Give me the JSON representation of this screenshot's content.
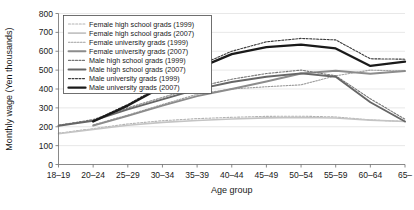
{
  "chart_data": {
    "type": "line",
    "title": "",
    "xlabel": "Age group",
    "ylabel": "Monthly wage (Yen thousands)",
    "categories": [
      "18–19",
      "20–24",
      "25–29",
      "30–34",
      "35–39",
      "40–44",
      "45–49",
      "50–54",
      "55–59",
      "60–64",
      "65–"
    ],
    "ylim": [
      0,
      800
    ],
    "yticks": [
      0,
      100,
      200,
      300,
      400,
      500,
      600,
      700,
      800
    ],
    "ytick_labels": [
      "0",
      "100",
      "200",
      "300",
      "400",
      "500",
      "600",
      "700",
      "800"
    ],
    "grid": true,
    "legend_position": "top-left",
    "series": [
      {
        "name": "Female high school grads (1999)",
        "color": "#b3b3b3",
        "width": 1.1,
        "dash": "2,1.6",
        "values": [
          166,
          190,
          215,
          232,
          243,
          250,
          255,
          256,
          252,
          236,
          228
        ]
      },
      {
        "name": "Female high school grads (2007)",
        "color": "#c4c4c4",
        "width": 1.6,
        "dash": "none",
        "values": [
          163,
          186,
          208,
          223,
          233,
          241,
          247,
          249,
          246,
          235,
          228
        ]
      },
      {
        "name": "Female university grads (1999)",
        "color": "#9e9e9e",
        "width": 1.1,
        "dash": "1.6,1.4",
        "values": [
          null,
          210,
          262,
          318,
          372,
          400,
          412,
          422,
          470,
          500,
          495
        ]
      },
      {
        "name": "Female university grads (2007)",
        "color": "#8c8c8c",
        "width": 1.9,
        "dash": "none",
        "values": [
          null,
          206,
          258,
          312,
          362,
          400,
          440,
          482,
          497,
          481,
          495
        ]
      },
      {
        "name": "Male high school grads (1999)",
        "color": "#777777",
        "width": 1.1,
        "dash": "2,1.5",
        "values": [
          208,
          238,
          300,
          355,
          410,
          452,
          482,
          500,
          470,
          348,
          240
        ]
      },
      {
        "name": "Male high school grads (2007)",
        "color": "#666666",
        "width": 1.9,
        "dash": "none",
        "values": [
          205,
          232,
          292,
          345,
          398,
          437,
          465,
          483,
          465,
          330,
          228
        ]
      },
      {
        "name": "Male university grads (1999)",
        "color": "#3d3d3d",
        "width": 1.1,
        "dash": "2,1.5",
        "values": [
          null,
          232,
          318,
          420,
          520,
          600,
          650,
          668,
          660,
          560,
          558
        ]
      },
      {
        "name": "Male university grads (2007)",
        "color": "#1a1a1a",
        "width": 2.3,
        "dash": "none",
        "values": [
          null,
          228,
          312,
          412,
          508,
          585,
          622,
          635,
          615,
          522,
          545
        ]
      }
    ]
  }
}
